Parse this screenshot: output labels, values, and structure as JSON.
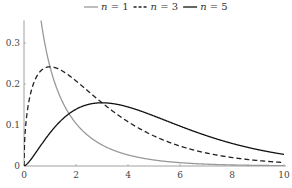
{
  "chart_data": {
    "type": "line",
    "title": "",
    "xlabel": "",
    "ylabel": "",
    "xlim": [
      0,
      10
    ],
    "ylim": [
      0,
      0.355
    ],
    "grid": false,
    "legend_position": "top-center",
    "x_ticks": [
      "0",
      "2",
      "4",
      "6",
      "8",
      "10"
    ],
    "y_ticks": [
      "0",
      "0.1",
      "0.2",
      "0.3"
    ],
    "series": [
      {
        "name": "n = 1",
        "var": "n",
        "value": "1",
        "style": "solid",
        "color": "#999999",
        "x": [
          0.05,
          0.2,
          0.5,
          1,
          1.5,
          2,
          3,
          4,
          5,
          6,
          7,
          8,
          9,
          10
        ],
        "values": [
          1.7,
          0.81,
          0.439,
          0.242,
          0.154,
          0.104,
          0.051,
          0.027,
          0.015,
          0.008,
          0.005,
          0.003,
          0.002,
          0.001
        ]
      },
      {
        "name": "n = 3",
        "var": "n",
        "value": "3",
        "style": "dashed",
        "color": "#222222",
        "x": [
          0,
          0.1,
          0.25,
          0.5,
          1,
          1.5,
          2,
          3,
          4,
          5,
          6,
          7,
          8,
          9,
          10
        ],
        "values": [
          0,
          0.12,
          0.176,
          0.22,
          0.242,
          0.231,
          0.208,
          0.154,
          0.108,
          0.073,
          0.048,
          0.032,
          0.021,
          0.013,
          0.008
        ]
      },
      {
        "name": "n = 5",
        "var": "n",
        "value": "5",
        "style": "solid",
        "color": "#111111",
        "x": [
          0,
          0.5,
          1,
          1.5,
          2,
          3,
          4,
          5,
          6,
          7,
          8,
          9,
          10
        ],
        "values": [
          0,
          0.037,
          0.081,
          0.116,
          0.138,
          0.154,
          0.144,
          0.122,
          0.097,
          0.074,
          0.055,
          0.039,
          0.028
        ]
      }
    ]
  },
  "legend": [
    {
      "var": "n",
      "eq": " = ",
      "value": "1"
    },
    {
      "var": "n",
      "eq": " = ",
      "value": "3"
    },
    {
      "var": "n",
      "eq": " = ",
      "value": "5"
    }
  ]
}
